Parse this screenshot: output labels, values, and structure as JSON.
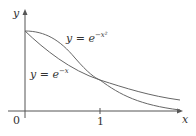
{
  "diagram": {
    "axes": {
      "x_label": "x",
      "y_label": "y",
      "origin_label": "0",
      "x_tick_label": "1"
    },
    "curves": [
      {
        "name": "exp-neg-x-squared",
        "label_base": "y = e",
        "label_exp": "−x²",
        "color": "#555555"
      },
      {
        "name": "exp-neg-x",
        "label_base": "y = e",
        "label_exp": "−x",
        "color": "#555555"
      }
    ]
  }
}
